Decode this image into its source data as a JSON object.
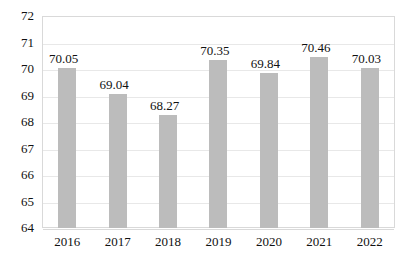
{
  "chart_data": {
    "type": "bar",
    "title": "",
    "subtitle": "",
    "xlabel": "",
    "ylabel": "",
    "categories": [
      "2016",
      "2017",
      "2018",
      "2019",
      "2020",
      "2021",
      "2022"
    ],
    "values": [
      70.05,
      69.04,
      68.27,
      70.35,
      69.84,
      70.46,
      70.03
    ],
    "data_labels": [
      "70.05",
      "69.04",
      "68.27",
      "70.35",
      "69.84",
      "70.46",
      "70.03"
    ],
    "ylim": [
      64,
      72
    ],
    "yticks": [
      64,
      65,
      66,
      67,
      68,
      69,
      70,
      71,
      72
    ],
    "ytick_labels": [
      "64",
      "65",
      "66",
      "67",
      "68",
      "69",
      "70",
      "71",
      "72"
    ],
    "grid": "horizontal",
    "legend": "none",
    "series": [
      {
        "name": "",
        "values": [
          70.05,
          69.04,
          68.27,
          70.35,
          69.84,
          70.46,
          70.03
        ],
        "color": "#bcbcbc"
      }
    ],
    "colors": {
      "bar": "#bcbcbc",
      "gridline": "#e8e8e8",
      "axis_border": "#d9d9d9",
      "text": "#111111",
      "background": "#ffffff"
    }
  }
}
